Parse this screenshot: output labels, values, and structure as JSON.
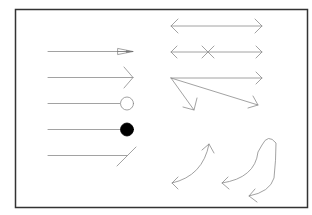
{
  "diagram": {
    "title": "Arrow and line-end styles",
    "colors": {
      "frame": "#333333",
      "line": "#8a8a8a",
      "fill_dot": "#000000",
      "background": "#ffffff"
    },
    "frame": {
      "x": 15.5,
      "y": 9.5,
      "width": 292,
      "height": 198,
      "stroke_width": 1.5
    },
    "left_column": [
      {
        "name": "line-with-cone-arrowhead",
        "x1": 48,
        "y1": 51.5,
        "x2": 133,
        "y2": 51.5,
        "end": "cone"
      },
      {
        "name": "line-with-open-arrowhead",
        "x1": 48,
        "y1": 77.5,
        "x2": 133,
        "y2": 77.5,
        "end": "open-arrow"
      },
      {
        "name": "line-with-open-circle",
        "x1": 48,
        "y1": 103.5,
        "x2": 120,
        "y2": 103.5,
        "end": "open-circle"
      },
      {
        "name": "line-with-filled-dot",
        "x1": 48,
        "y1": 129.5,
        "x2": 120,
        "y2": 129.5,
        "end": "filled-dot"
      },
      {
        "name": "line-with-slash-end",
        "x1": 48,
        "y1": 155.5,
        "x2": 127,
        "y2": 155.5,
        "end": "slash"
      }
    ],
    "right_column": [
      {
        "name": "double-headed-arrow",
        "x1": 171,
        "y1": 26,
        "x2": 262,
        "y2": 26
      },
      {
        "name": "double-headed-arrow-with-cross-marker",
        "x1": 171,
        "y1": 52,
        "x2": 262,
        "y2": 52,
        "marker_x": 208
      },
      {
        "name": "fan-of-arrows-from-origin",
        "origin_x": 171,
        "origin_y": 78,
        "targets": [
          {
            "x": 262,
            "y": 78
          },
          {
            "x": 258,
            "y": 105
          },
          {
            "x": 194,
            "y": 110
          }
        ]
      },
      {
        "name": "curved-double-headed-arrow",
        "start_x": 172,
        "start_y": 183,
        "end_x": 209,
        "end_y": 144
      },
      {
        "name": "looping-curved-arrow",
        "start_x": 222,
        "start_y": 183,
        "end_x": 249,
        "end_y": 196
      }
    ]
  }
}
